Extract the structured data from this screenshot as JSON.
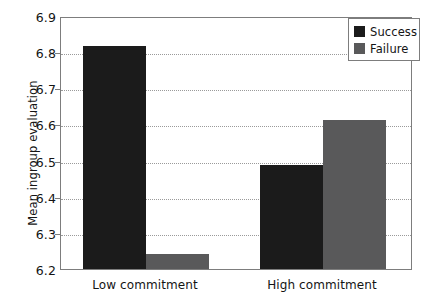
{
  "chart_data": {
    "type": "bar",
    "title": "",
    "xlabel": "",
    "ylabel": "Mean ingroup evaluation",
    "categories": [
      "Low commitment",
      "High commitment"
    ],
    "series": [
      {
        "name": "Success",
        "color": "#1b1b1b",
        "values": [
          6.817,
          6.489
        ]
      },
      {
        "name": "Failure",
        "color": "#59595a",
        "values": [
          6.241,
          6.613
        ]
      }
    ],
    "ylim": [
      6.2,
      6.9
    ],
    "yticks": [
      6.2,
      6.3,
      6.4,
      6.5,
      6.6,
      6.7,
      6.8,
      6.9
    ],
    "ytick_labels": [
      "6.2",
      "6.3",
      "6.4",
      "6.5",
      "6.6",
      "6.7",
      "6.8",
      "6.9"
    ],
    "grid": true,
    "grid_style": "dotted",
    "legend_position": "top-right",
    "legend_entries": [
      "Success",
      "Failure"
    ]
  },
  "axes": {
    "y_title": "Mean ingroup evaluation"
  },
  "legend": {
    "entries": [
      {
        "label": "Success",
        "color": "#1b1b1b"
      },
      {
        "label": "Failure",
        "color": "#59595a"
      }
    ]
  }
}
